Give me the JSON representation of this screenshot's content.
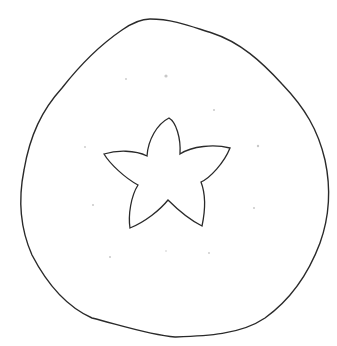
{
  "drawing": {
    "subject": "persimmon top view line drawing",
    "stroke_color": "#2a2a2a",
    "background_color": "#ffffff",
    "speck_color": "#c8c8c8"
  }
}
